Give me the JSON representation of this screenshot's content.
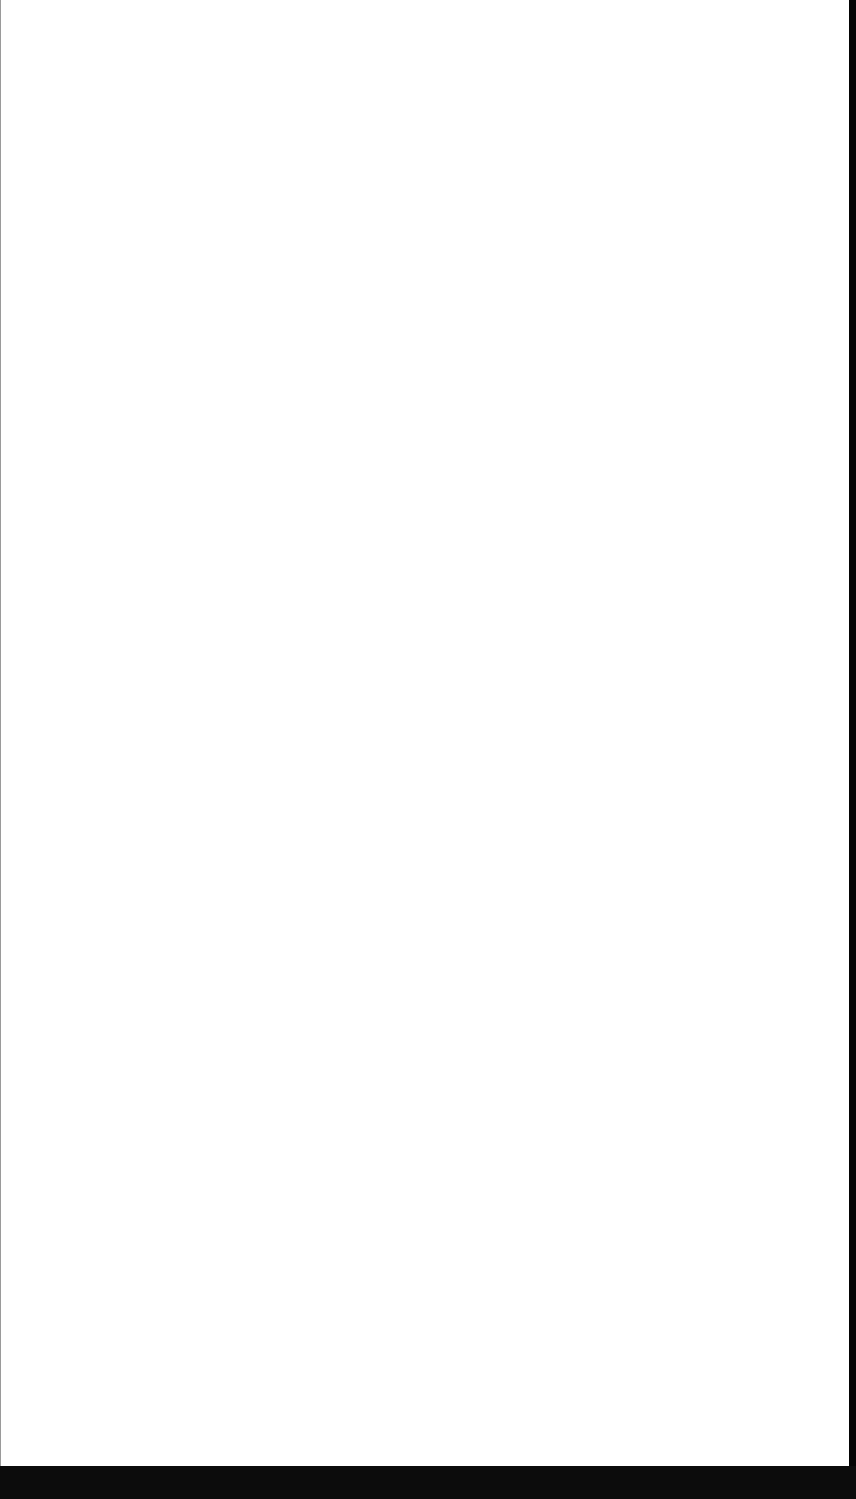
{
  "page": {
    "state": "blank",
    "background_color": "#ffffff"
  },
  "chrome": {
    "bottom_bar_color": "#0c0c0c",
    "right_strip_color": "#050505"
  }
}
